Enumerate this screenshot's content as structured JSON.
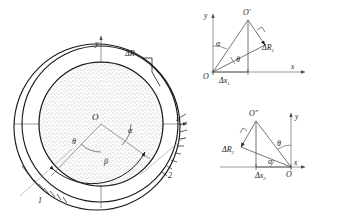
{
  "figure": {
    "background_color": "#ffffff",
    "line_color": "#1a1a1a",
    "thin_line_color": "#6e6e6e",
    "stipple_color": "#8a8a8a"
  },
  "main_diagram": {
    "name": "eccentric-annulus",
    "axes": {
      "x_label": "x",
      "y_label": "y"
    },
    "center_label": "O",
    "angles": [
      {
        "symbol": "θ",
        "name": "theta"
      },
      {
        "symbol": "α",
        "name": "alpha"
      },
      {
        "symbol": "β",
        "name": "beta"
      }
    ],
    "clearance_label": "ΔR",
    "contact_labels": [
      {
        "text": "1",
        "name": "contact-point-1"
      },
      {
        "text": "2",
        "name": "contact-point-2"
      }
    ],
    "circles": [
      {
        "name": "outer-housing-circle",
        "cx": 97,
        "cy": 126,
        "r": 83
      },
      {
        "name": "bore-circle",
        "cx": 100,
        "cy": 124,
        "r": 78
      },
      {
        "name": "shaft-circle",
        "cx": 101,
        "cy": 124,
        "r": 62
      }
    ]
  },
  "triangle_top": {
    "name": "offset-triangle-1",
    "origin_label": "O",
    "apex_label": "O′",
    "axis_x_label": "x",
    "axis_y_label": "y",
    "angle_alpha": "α",
    "angle_theta": "θ",
    "radial_label": "ΔR",
    "radial_sub": "1",
    "horizontal_label": "Δx",
    "horizontal_sub": "1"
  },
  "triangle_bottom": {
    "name": "offset-triangle-2",
    "origin_label": "O",
    "apex_label": "O″",
    "axis_x_label": "x",
    "axis_y_label": "y",
    "angle_alpha": "α",
    "angle_theta": "θ",
    "radial_label": "ΔR",
    "radial_sub": "2",
    "horizontal_label": "Δx",
    "horizontal_sub": "2"
  }
}
